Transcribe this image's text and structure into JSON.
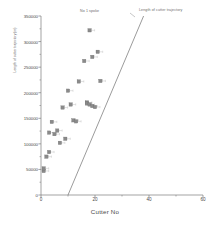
{
  "chart_data": {
    "type": "scatter",
    "title": "",
    "xlabel": "Cutter No",
    "ylabel": "Length of cutter trajectory (m)",
    "xlim": [
      0,
      60
    ],
    "ylim": [
      0,
      350000
    ],
    "xticks": [
      0,
      20,
      40,
      60
    ],
    "yticks": [
      0,
      50000,
      100000,
      150000,
      200000,
      250000,
      300000,
      350000
    ],
    "xtick_labels": [
      "0",
      "20",
      "40",
      "60"
    ],
    "ytick_labels": [
      "0",
      "50000",
      "100000",
      "150000",
      "200000",
      "250000",
      "300000",
      "350000"
    ],
    "grid": false,
    "legend": "none",
    "minor_ticks": true,
    "annotations": [
      {
        "name": "no-1-spoke",
        "text": "No 1 spoke",
        "x": 18,
        "y": 345000
      },
      {
        "name": "length-of-cutter-trajectory",
        "text": "Length of cutter trajectory",
        "x": 39,
        "y": 349000
      }
    ],
    "series": [
      {
        "name": "Cutter trajectory points",
        "type": "scatter",
        "marker": "square",
        "color": "#8a8a8a",
        "errorbars": true,
        "points": [
          {
            "x": 1,
            "y": 47000
          },
          {
            "x": 1,
            "y": 52000
          },
          {
            "x": 2,
            "y": 75000
          },
          {
            "x": 3,
            "y": 84000
          },
          {
            "x": 3,
            "y": 122000
          },
          {
            "x": 4,
            "y": 143000
          },
          {
            "x": 5,
            "y": 119000
          },
          {
            "x": 6,
            "y": 126000
          },
          {
            "x": 7,
            "y": 102000
          },
          {
            "x": 8,
            "y": 171000
          },
          {
            "x": 9,
            "y": 110000
          },
          {
            "x": 10,
            "y": 204000
          },
          {
            "x": 11,
            "y": 177000
          },
          {
            "x": 12,
            "y": 146000
          },
          {
            "x": 13,
            "y": 144000
          },
          {
            "x": 14,
            "y": 222000
          },
          {
            "x": 16,
            "y": 262000
          },
          {
            "x": 17,
            "y": 181000
          },
          {
            "x": 17,
            "y": 179000
          },
          {
            "x": 18,
            "y": 177000
          },
          {
            "x": 18,
            "y": 322000
          },
          {
            "x": 19,
            "y": 270000
          },
          {
            "x": 19,
            "y": 174000
          },
          {
            "x": 20,
            "y": 172000
          },
          {
            "x": 21,
            "y": 280000
          },
          {
            "x": 22,
            "y": 223000
          }
        ]
      },
      {
        "name": "Length of cutter trajectory",
        "type": "line",
        "color": "#7a7a7a",
        "points": [
          {
            "x": 10,
            "y": 0
          },
          {
            "x": 38,
            "y": 350000
          }
        ]
      }
    ]
  }
}
